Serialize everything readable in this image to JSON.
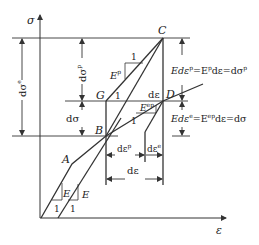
{
  "diagram": {
    "axes": {
      "y_label": "σ",
      "x_label": "ε"
    },
    "points": {
      "A": "A",
      "B": "B",
      "C": "C",
      "D": "D",
      "G": "G"
    },
    "slopes": {
      "elastic_1": "E",
      "elastic_2": "E",
      "unit_1": "1",
      "unit_2": "1",
      "plastic": "E",
      "plastic_sup": "p",
      "plastic_unit": "1",
      "ep": "E",
      "ep_sup": "ep",
      "ep_unit": "1",
      "g_unit": "1"
    },
    "dimensions": {
      "d_sigma_e": "dσ",
      "d_sigma_e_sup": "e",
      "d_sigma_p": "dσ",
      "d_sigma_p_sup": "p",
      "d_sigma": "dσ",
      "d_eps": "dε",
      "d_eps_top": "dε",
      "d_eps_p": "dε",
      "d_eps_p_sup": "p",
      "d_eps_e": "dε",
      "d_eps_e_sup": "e"
    },
    "equations": {
      "plastic": {
        "a": "Edε",
        "a_sup": "p",
        "b": "=E",
        "b_sup": "p",
        "c": "dε=dσ",
        "c_sup": "p"
      },
      "elastic": {
        "a": "Edε",
        "a_sup": "e",
        "b": "=E",
        "b_sup": "ep",
        "c": "dε=dσ"
      }
    },
    "colors": {
      "line": "#333333",
      "text": "#222222",
      "background": "#ffffff"
    }
  }
}
